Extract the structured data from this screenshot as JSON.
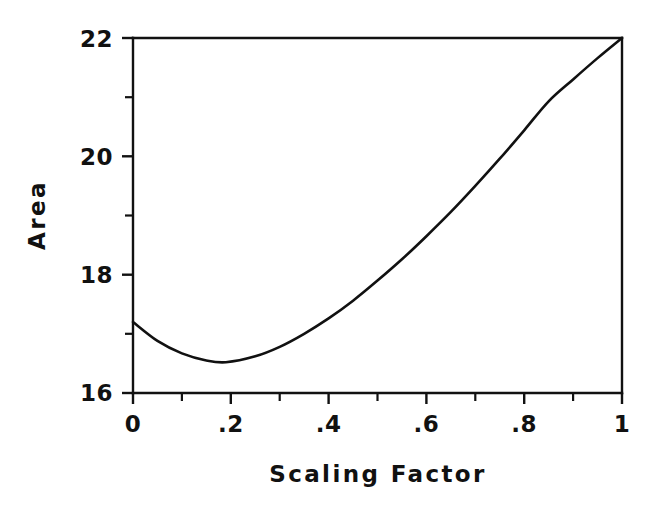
{
  "chart_data": {
    "type": "line",
    "title": "",
    "xlabel": "Scaling Factor",
    "ylabel": "Area",
    "xlim": [
      0,
      1
    ],
    "ylim": [
      16,
      22
    ],
    "grid": false,
    "legend": null,
    "x_tick_labels": [
      "0",
      ".2",
      ".4",
      ".6",
      ".8",
      "1"
    ],
    "x_tick_values": [
      0,
      0.2,
      0.4,
      0.6,
      0.8,
      1
    ],
    "x_minor_tick_values": [
      0.1,
      0.3,
      0.5,
      0.7,
      0.9
    ],
    "y_tick_labels": [
      "16",
      "18",
      "20",
      "22"
    ],
    "y_tick_values": [
      16,
      18,
      20,
      22
    ],
    "y_minor_tick_values": [
      17,
      19,
      21
    ],
    "line_color": "#111111",
    "series": [
      {
        "name": "Area vs Scaling Factor",
        "x": [
          0.0,
          0.05,
          0.1,
          0.15,
          0.19,
          0.25,
          0.3,
          0.35,
          0.4,
          0.45,
          0.5,
          0.55,
          0.6,
          0.65,
          0.7,
          0.75,
          0.8,
          0.85,
          0.9,
          0.95,
          1.0
        ],
        "y": [
          17.2,
          16.88,
          16.67,
          16.55,
          16.52,
          16.62,
          16.78,
          17.0,
          17.26,
          17.56,
          17.9,
          18.26,
          18.65,
          19.06,
          19.5,
          19.96,
          20.44,
          20.93,
          21.3,
          21.66,
          22.0
        ]
      }
    ]
  },
  "axes": {
    "y_label_text": "Area",
    "x_label_text": "Scaling Factor"
  }
}
